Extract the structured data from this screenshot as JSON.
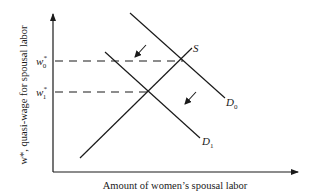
{
  "diagram": {
    "type": "supply-demand",
    "axes": {
      "xlabel": "Amount of women’s spousal labor",
      "ylabel": "w*, quasi-wage for spousal labor"
    },
    "ticks": {
      "w0": {
        "base": "w",
        "sup": "*",
        "sub": "0"
      },
      "w1": {
        "base": "w",
        "sup": "*",
        "sub": "1"
      }
    },
    "curves": {
      "supply": {
        "base": "S",
        "sub": ""
      },
      "demand0": {
        "base": "D",
        "sub": "0"
      },
      "demand1": {
        "base": "D",
        "sub": "1"
      }
    },
    "annotations": [
      "shift-arrow-upper",
      "shift-arrow-lower"
    ],
    "colors": {
      "line": "#1a1a1a",
      "background": "#ffffff"
    }
  }
}
